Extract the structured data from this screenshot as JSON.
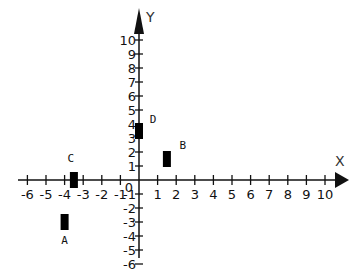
{
  "chart_data": {
    "type": "scatter",
    "title": "",
    "xlabel": "X",
    "ylabel": "Y",
    "xlim": [
      -6,
      10
    ],
    "ylim": [
      -6,
      10
    ],
    "grid": false,
    "x_ticks": [
      -6,
      -5,
      -4,
      -3,
      -2,
      -1,
      0,
      1,
      2,
      3,
      4,
      5,
      6,
      7,
      8,
      9,
      10
    ],
    "y_ticks": [
      -6,
      -5,
      -4,
      -3,
      -2,
      -1,
      0,
      1,
      2,
      3,
      4,
      5,
      6,
      7,
      8,
      9,
      10
    ],
    "points": [
      {
        "label": "A",
        "x": -4,
        "y": -3
      },
      {
        "label": "B",
        "x": 1.5,
        "y": 1.5
      },
      {
        "label": "C",
        "x": -3.5,
        "y": 0
      },
      {
        "label": "D",
        "x": 0,
        "y": 3.5
      }
    ],
    "marker": "rectangle",
    "color": "#000000"
  }
}
